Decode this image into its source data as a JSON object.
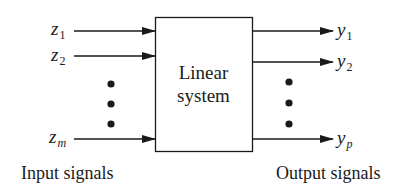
{
  "block": {
    "line1": "Linear",
    "line2": "system"
  },
  "inputs": [
    {
      "symbol": "z",
      "subscript": "1",
      "subscript_italic": false
    },
    {
      "symbol": "z",
      "subscript": "2",
      "subscript_italic": false
    },
    {
      "symbol": "z",
      "subscript": "m",
      "subscript_italic": true
    }
  ],
  "outputs": [
    {
      "symbol": "y",
      "subscript": "1",
      "subscript_italic": false
    },
    {
      "symbol": "y",
      "subscript": "2",
      "subscript_italic": false
    },
    {
      "symbol": "y",
      "subscript": "p",
      "subscript_italic": true
    }
  ],
  "captions": {
    "inputs": "Input signals",
    "outputs": "Output signals"
  },
  "colors": {
    "stroke": "#1a1a1a",
    "background": "#ffffff"
  }
}
